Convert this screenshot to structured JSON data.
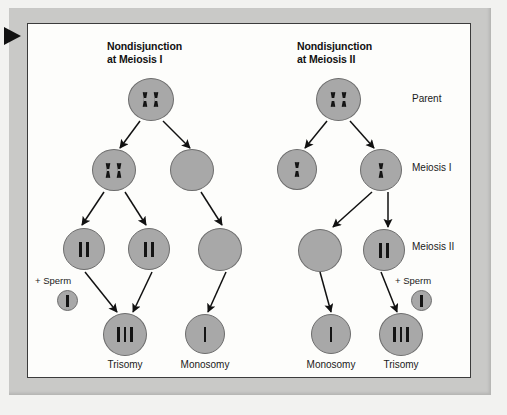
{
  "figure": {
    "marker_icon": "black-right-triangle-marker",
    "panels": [
      {
        "id": "meiosis-i",
        "title": "Nondisjunction\nat Meiosis I"
      },
      {
        "id": "meiosis-ii",
        "title": "Nondisjunction\nat Meiosis II"
      }
    ],
    "row_labels": [
      {
        "id": "parent",
        "label": "Parent"
      },
      {
        "id": "meiosis-1",
        "label": "Meiosis I"
      },
      {
        "id": "meiosis-2",
        "label": "Meiosis II"
      }
    ],
    "sperm_labels": [
      {
        "id": "sperm-left",
        "label": "+ Sperm"
      },
      {
        "id": "sperm-right",
        "label": "+ Sperm"
      }
    ],
    "outcomes": [
      {
        "id": "outcome-1",
        "label": "Trisomy"
      },
      {
        "id": "outcome-2",
        "label": "Monosomy"
      },
      {
        "id": "outcome-3",
        "label": "Monosomy"
      },
      {
        "id": "outcome-4",
        "label": "Trisomy"
      }
    ],
    "colors": {
      "cell_fill": "#a8a8a8",
      "cell_stroke": "#6d6d6d",
      "chromosome": "#141414",
      "panel_background": "#fdfdfb",
      "frame_gray": "#c9c9c7",
      "border": "#3b3b3b",
      "text": "#1a1a1a"
    },
    "cells": [
      {
        "id": "left-parent",
        "panel": "meiosis-i",
        "stage": "Parent",
        "chromosomes": "XX",
        "count": 2
      },
      {
        "id": "left-m1-a",
        "panel": "meiosis-i",
        "stage": "Meiosis I",
        "chromosomes": "XX",
        "count": 2
      },
      {
        "id": "left-m1-b",
        "panel": "meiosis-i",
        "stage": "Meiosis I",
        "chromosomes": "",
        "count": 0
      },
      {
        "id": "left-m2-a",
        "panel": "meiosis-i",
        "stage": "Meiosis II",
        "chromosomes": "||",
        "count": 2
      },
      {
        "id": "left-m2-b",
        "panel": "meiosis-i",
        "stage": "Meiosis II",
        "chromosomes": "||",
        "count": 2
      },
      {
        "id": "left-m2-c",
        "panel": "meiosis-i",
        "stage": "Meiosis II",
        "chromosomes": "",
        "count": 0
      },
      {
        "id": "left-sperm",
        "panel": "meiosis-i",
        "stage": "Sperm",
        "chromosomes": "|",
        "count": 1
      },
      {
        "id": "left-trisomy",
        "panel": "meiosis-i",
        "stage": "Zygote",
        "chromosomes": "|||",
        "count": 3
      },
      {
        "id": "left-monosomy",
        "panel": "meiosis-i",
        "stage": "Zygote",
        "chromosomes": "|",
        "count": 1
      },
      {
        "id": "right-parent",
        "panel": "meiosis-ii",
        "stage": "Parent",
        "chromosomes": "XX",
        "count": 2
      },
      {
        "id": "right-m1-a",
        "panel": "meiosis-ii",
        "stage": "Meiosis I",
        "chromosomes": "X",
        "count": 1
      },
      {
        "id": "right-m1-b",
        "panel": "meiosis-ii",
        "stage": "Meiosis I",
        "chromosomes": "X",
        "count": 1
      },
      {
        "id": "right-m2-a",
        "panel": "meiosis-ii",
        "stage": "Meiosis II",
        "chromosomes": "",
        "count": 0
      },
      {
        "id": "right-m2-b",
        "panel": "meiosis-ii",
        "stage": "Meiosis II",
        "chromosomes": "||",
        "count": 2
      },
      {
        "id": "right-sperm",
        "panel": "meiosis-ii",
        "stage": "Sperm",
        "chromosomes": "|",
        "count": 1
      },
      {
        "id": "right-monosomy",
        "panel": "meiosis-ii",
        "stage": "Zygote",
        "chromosomes": "|",
        "count": 1
      },
      {
        "id": "right-trisomy",
        "panel": "meiosis-ii",
        "stage": "Zygote",
        "chromosomes": "|||",
        "count": 3
      }
    ]
  }
}
